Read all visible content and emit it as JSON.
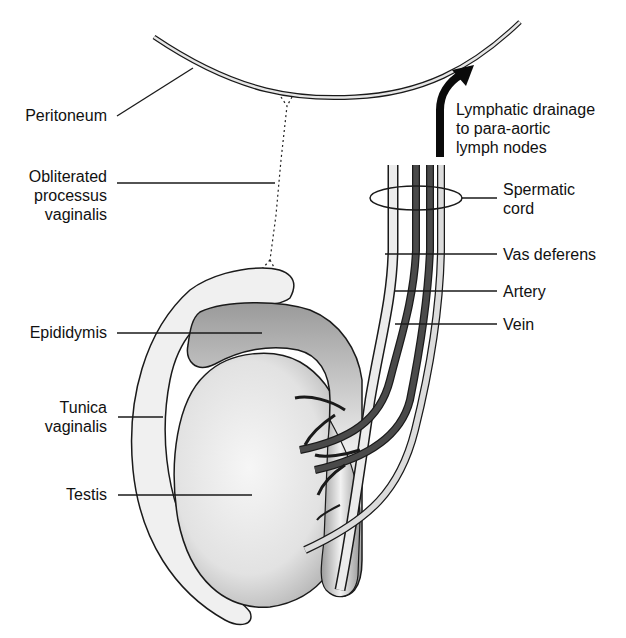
{
  "labels": {
    "peritoneum": "Peritoneum",
    "obliterated_processus_vaginalis": "Obliterated\nprocessus\nvaginalis",
    "epididymis": "Epididymis",
    "tunica_vaginalis": "Tunica\nvaginalis",
    "testis": "Testis",
    "lymphatic_drainage": "Lymphatic drainage\nto para-aortic\nlymph nodes",
    "spermatic_cord": "Spermatic\ncord",
    "vas_deferens": "Vas deferens",
    "artery": "Artery",
    "vein": "Vein"
  },
  "colors": {
    "outline": "#1a1a1a",
    "tunica_fill": "#efefef",
    "testis_fill": "#e4e4e4",
    "artery_fill": "#4a4a4a",
    "vein_fill": "#d8d8d8",
    "arrow": "#0a0a0a"
  }
}
